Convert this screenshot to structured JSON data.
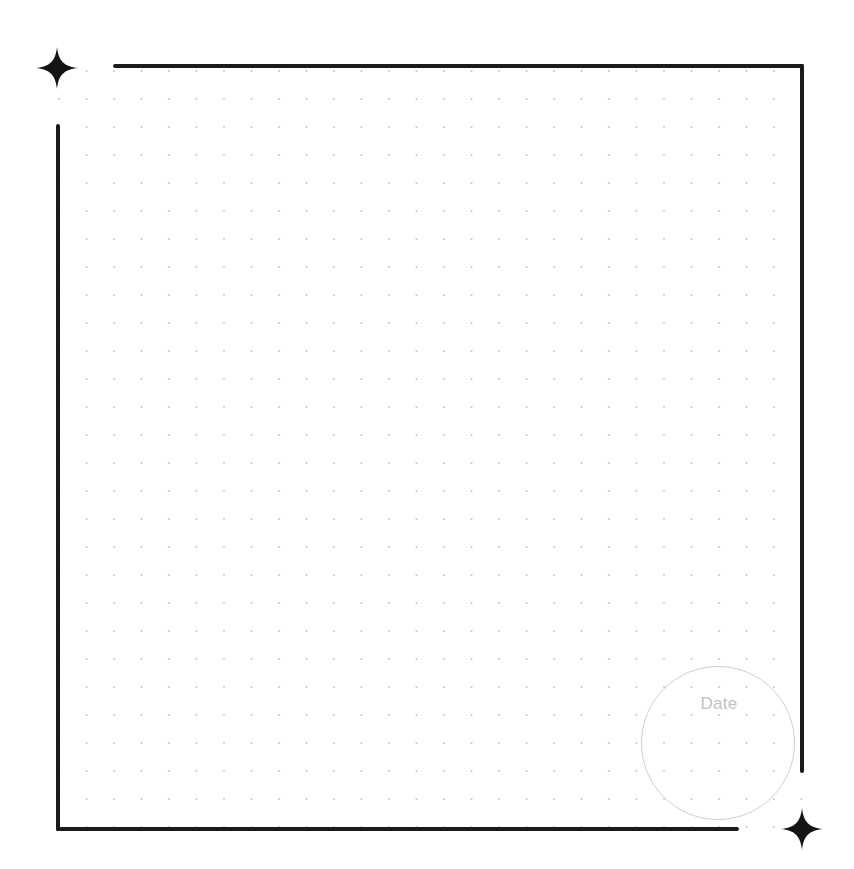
{
  "page": {
    "type": "dot-grid journal page",
    "background_color": "#ffffff",
    "frame_color": "#1b1b1b",
    "dot_color": "#c9c9c9"
  },
  "dot_grid": {
    "columns": 28,
    "rows": 28,
    "start_x": 59,
    "start_y": 71,
    "spacing_x": 27.5,
    "spacing_y": 28,
    "dot_radius": 1.1
  },
  "decorations": {
    "top_left_icon": "sparkle-icon",
    "bottom_right_icon": "sparkle-icon"
  },
  "date_stamp": {
    "label": "Date",
    "value": "",
    "border_color": "#cfcfcf",
    "label_color": "#c2c2c2"
  }
}
